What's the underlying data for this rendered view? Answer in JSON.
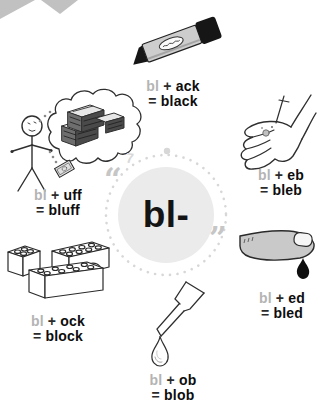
{
  "center": {
    "label": "bl-",
    "open_quote": "“",
    "close_quote": "”",
    "corner_mark": "7"
  },
  "items": [
    {
      "id": "black",
      "icon": "marker-pen-icon",
      "prefix": "bl",
      "operator": "+",
      "suffix": "ack",
      "equals": "=",
      "word": "black"
    },
    {
      "id": "bluff",
      "icon": "stick-figure-daydream-icon",
      "prefix": "bl",
      "operator": "+",
      "suffix": "uff",
      "equals": "=",
      "word": "bluff"
    },
    {
      "id": "bleb",
      "icon": "hand-blister-icon",
      "prefix": "bl",
      "operator": "+",
      "suffix": "eb",
      "equals": "=",
      "word": "bleb"
    },
    {
      "id": "bled",
      "icon": "bleeding-finger-icon",
      "prefix": "bl",
      "operator": "+",
      "suffix": "ed",
      "equals": "=",
      "word": "bled"
    },
    {
      "id": "block",
      "icon": "building-blocks-icon",
      "prefix": "bl",
      "operator": "+",
      "suffix": "ock",
      "equals": "=",
      "word": "block"
    },
    {
      "id": "blob",
      "icon": "dropper-drop-icon",
      "prefix": "bl",
      "operator": "+",
      "suffix": "ob",
      "equals": "=",
      "word": "blob"
    }
  ],
  "colors": {
    "prefix_gray": "#b4b4b4",
    "text_black": "#0d0d0d",
    "circle_fill": "#ebebeb",
    "dot_gray": "#d7d7d7",
    "quote_gray": "#c6c6c6",
    "corner_gray": "#c1c1c1"
  }
}
